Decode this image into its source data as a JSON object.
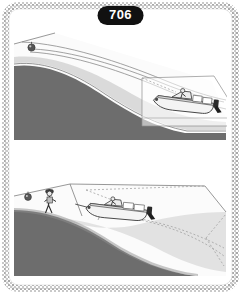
{
  "figure": {
    "number_label": "706",
    "border_style": "stippled-rounded-rectangle",
    "background_color": "#ffffff"
  },
  "colors": {
    "water_dark": "#6d6d6d",
    "water_mid": "#9a9a9a",
    "shallow_light": "#e2e2e2",
    "shore_white": "#fbfbfb",
    "outline": "#555555",
    "badge_bg": "#111111",
    "badge_text": "#ffffff",
    "border_stipple": "#b6b6b6"
  },
  "panels": [
    {
      "id": "upper-panel",
      "name": "boat-approaching-mooring-buoy",
      "elements": [
        {
          "name": "mooring-buoy",
          "type": "buoy",
          "x": 32,
          "y": 48
        },
        {
          "name": "mooring-line",
          "type": "line"
        },
        {
          "name": "motorboat",
          "type": "boat",
          "x": 185,
          "y": 102,
          "heading": "right"
        },
        {
          "name": "helmsman",
          "type": "person"
        },
        {
          "name": "outboard-motor",
          "type": "motor"
        },
        {
          "name": "deep-water",
          "type": "water-region",
          "shade": "dark"
        },
        {
          "name": "shallow-water",
          "type": "water-region",
          "shade": "light"
        },
        {
          "name": "shoreline",
          "type": "curve"
        },
        {
          "name": "perspective-guide",
          "type": "dashed-line"
        }
      ]
    },
    {
      "id": "lower-panel",
      "name": "boat-departing-from-shore",
      "elements": [
        {
          "name": "mooring-buoy",
          "type": "buoy",
          "x": 28,
          "y": 196
        },
        {
          "name": "person-on-shore",
          "type": "person",
          "x": 48,
          "y": 202
        },
        {
          "name": "motorboat",
          "type": "boat",
          "x": 118,
          "y": 210,
          "heading": "left"
        },
        {
          "name": "helmsman",
          "type": "person"
        },
        {
          "name": "outboard-motor",
          "type": "motor"
        },
        {
          "name": "deep-water",
          "type": "water-region",
          "shade": "dark"
        },
        {
          "name": "shallow-water",
          "type": "water-region",
          "shade": "light"
        },
        {
          "name": "shoreline",
          "type": "curve"
        },
        {
          "name": "perspective-guide",
          "type": "dashed-line"
        }
      ]
    }
  ]
}
